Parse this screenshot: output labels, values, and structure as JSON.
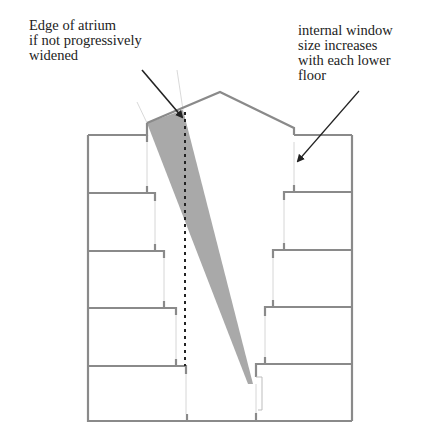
{
  "diagram": {
    "type": "building-section",
    "colors": {
      "wall": "#8a8a8a",
      "wedge_fill": "#a9a9a9",
      "dashed_line": "#222222",
      "arrow": "#222222",
      "window_line": "#d0d0d0"
    },
    "floors": 5
  },
  "annotations": {
    "left": {
      "line1": "Edge of atrium",
      "line2": "if not progressively",
      "line3": "widened"
    },
    "right": {
      "line1": "internal window",
      "line2": "size increases",
      "line3": "with each lower",
      "line4": "floor"
    }
  }
}
